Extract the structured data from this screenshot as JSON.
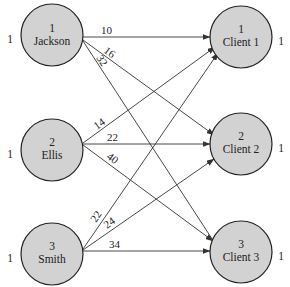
{
  "diagram": {
    "type": "bipartite-assignment-network",
    "sources": [
      {
        "id": "1",
        "name": "Jackson",
        "supply": "1"
      },
      {
        "id": "2",
        "name": "Ellis",
        "supply": "1"
      },
      {
        "id": "3",
        "name": "Smith",
        "supply": "1"
      }
    ],
    "destinations": [
      {
        "id": "1",
        "name": "Client 1",
        "demand": "1"
      },
      {
        "id": "2",
        "name": "Client 2",
        "demand": "1"
      },
      {
        "id": "3",
        "name": "Client 3",
        "demand": "1"
      }
    ],
    "edges": [
      {
        "from": "Jackson",
        "to": "Client 1",
        "cost": "10"
      },
      {
        "from": "Jackson",
        "to": "Client 2",
        "cost": "16"
      },
      {
        "from": "Jackson",
        "to": "Client 3",
        "cost": "32"
      },
      {
        "from": "Ellis",
        "to": "Client 1",
        "cost": "14"
      },
      {
        "from": "Ellis",
        "to": "Client 2",
        "cost": "22"
      },
      {
        "from": "Ellis",
        "to": "Client 3",
        "cost": "40"
      },
      {
        "from": "Smith",
        "to": "Client 1",
        "cost": "22"
      },
      {
        "from": "Smith",
        "to": "Client 2",
        "cost": "24"
      },
      {
        "from": "Smith",
        "to": "Client 3",
        "cost": "34"
      }
    ]
  },
  "colors": {
    "node_fill": "#d2d2d2",
    "stroke": "#222222",
    "background": "#ffffff"
  }
}
